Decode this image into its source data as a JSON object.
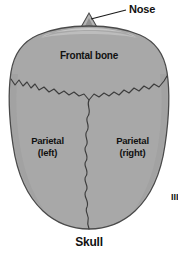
{
  "figure": {
    "caption": "Skull",
    "labels": {
      "nose": "Nose",
      "frontal_bone": "Frontal bone",
      "parietal_left_line1": "Parietal",
      "parietal_left_line2": "(left)",
      "parietal_right_line1": "Parietal",
      "parietal_right_line2": "(right)"
    },
    "margin_fragment": "III",
    "colors": {
      "background": "#ffffff",
      "bone_fill": "#a8a8a8",
      "bone_highlight": "#c2c2c2",
      "outline": "#4a4a4a",
      "suture": "#3c3c3c",
      "text": "#111111",
      "leader_line": "#1a1a1a"
    },
    "structures": [
      "nose",
      "frontal bone",
      "parietal bone (left)",
      "parietal bone (right)",
      "coronal suture",
      "sagittal suture"
    ]
  }
}
